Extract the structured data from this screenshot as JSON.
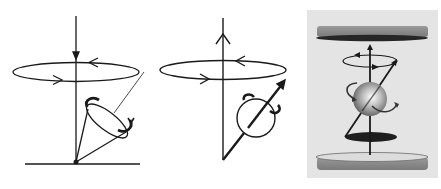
{
  "figure": {
    "panels": [
      {
        "id": "precession-cone",
        "label": "Precessing spin cone around vertical axis (downward arrow) above ground line"
      },
      {
        "id": "spinning-sphere",
        "label": "Spinning sphere with tilted magnetic moment precessing about upward axis"
      },
      {
        "id": "field-cylinder",
        "label": "Shaded spinning sphere between two magnetic plates with precession orbit"
      }
    ]
  },
  "colors": {
    "line": "#1a1a1a",
    "panel3_bg": "#e4e4e4",
    "plate_gray": "#8a8a8a",
    "plate_dark": "#262626",
    "plate_light": "#d8d8d8"
  }
}
